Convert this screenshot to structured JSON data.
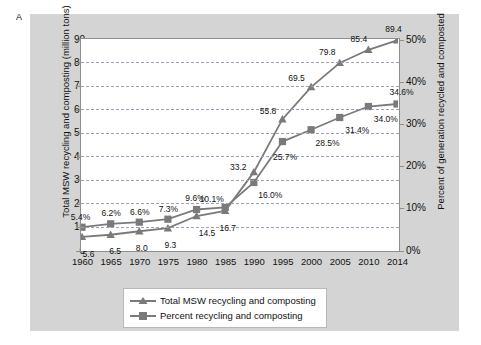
{
  "panel": {
    "letter": "A",
    "background_color": "#d4d4d4",
    "plot_background_color": "#ffffff",
    "series_color": "#7a7a7a",
    "grid_color": "#9aa3b5"
  },
  "chart_data": {
    "type": "line",
    "title": "",
    "xlabel": "",
    "ylabel": "Total MSW recycling and composting (million tons)",
    "y2label": "Percent of generation recycled and composted",
    "categories": [
      "1960",
      "1965",
      "1970",
      "1975",
      "1980",
      "1985",
      "1990",
      "1995",
      "2000",
      "2005",
      "2010",
      "2014"
    ],
    "ylim": [
      0,
      90
    ],
    "yticks": [
      "0",
      "10",
      "20",
      "30",
      "40",
      "50",
      "60",
      "70",
      "80",
      "90"
    ],
    "y2lim": [
      0,
      50
    ],
    "y2ticks": [
      "0%",
      "10%",
      "20%",
      "30%",
      "40%",
      "50%"
    ],
    "grid": true,
    "legend_position": "bottom",
    "series": [
      {
        "name": "Total MSW recycling and composting",
        "axis": "left",
        "marker": "triangle",
        "color": "#7a7a7a",
        "values": [
          5.6,
          6.5,
          8.0,
          9.3,
          14.5,
          16.7,
          33.2,
          55.8,
          69.5,
          79.8,
          85.4,
          89.4
        ],
        "labels": [
          "5.6",
          "6.5",
          "8.0",
          "9.3",
          "14.5",
          "16.7",
          "33.2",
          "55.8",
          "69.5",
          "79.8",
          "85.4",
          "89.4"
        ]
      },
      {
        "name": "Percent recycling and composting",
        "axis": "right",
        "marker": "square",
        "color": "#7a7a7a",
        "values": [
          5.4,
          6.2,
          6.6,
          7.3,
          9.6,
          10.1,
          16.0,
          25.7,
          28.5,
          31.4,
          34.0,
          34.6
        ],
        "labels": [
          "5.4%",
          "6.2%",
          "6.6%",
          "7.3%",
          "9.6%",
          "10.1%",
          "16.0%",
          "25.7%",
          "28.5%",
          "31.4%",
          "34.0%",
          "34.6%"
        ]
      }
    ]
  },
  "legend": {
    "items": [
      {
        "label": "Total MSW recycling and composting",
        "marker": "triangle"
      },
      {
        "label": "Percent recycling and composting",
        "marker": "square"
      }
    ]
  }
}
